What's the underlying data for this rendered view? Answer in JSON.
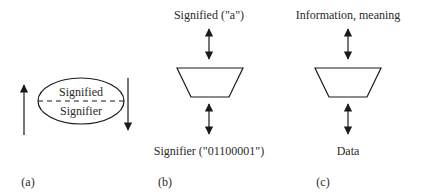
{
  "panels": {
    "a": {
      "label": "(a)",
      "top_text": "Signified",
      "bottom_text": "Signifier"
    },
    "b": {
      "label": "(b)",
      "top_text": "Signified (\"a\")",
      "bottom_text": "Signifier (\"01100001\")"
    },
    "c": {
      "label": "(c)",
      "top_text": "Information, meaning",
      "bottom_text": "Data"
    }
  },
  "colors": {
    "stroke": "#1a1a1a",
    "text": "#2a2a2a",
    "background": "#ffffff"
  }
}
